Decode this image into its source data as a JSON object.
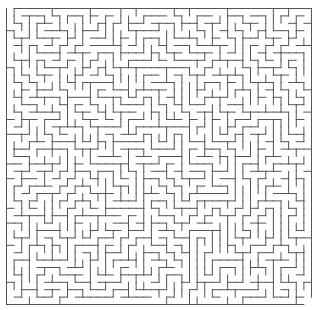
{
  "puzzle": {
    "type": "maze",
    "cols": 40,
    "rows": 40,
    "bounds": {
      "x": 6.5,
      "y": 8.5,
      "width": 305,
      "height": 296
    },
    "wall_color": "#555555",
    "background_color": "#ffffff",
    "wall_width": 1,
    "entrance": {
      "side": "top",
      "col": 0
    },
    "exit": {
      "side": "right",
      "row": 39
    },
    "seed": 12345
  }
}
